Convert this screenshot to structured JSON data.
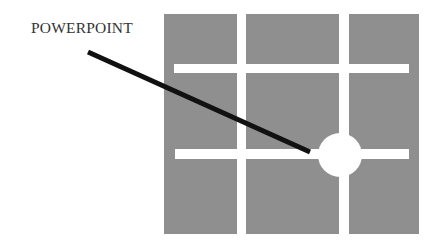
{
  "label": {
    "text": "POWERPOINT"
  },
  "colors": {
    "background": "#ffffff",
    "block": "#8f8f8f",
    "channel": "#ffffff",
    "pointer": "#111111",
    "label": "#333333"
  },
  "grid": {
    "outer": {
      "x": 164,
      "y": 14,
      "width": 255,
      "height": 220
    },
    "columns": [
      {
        "x": 164,
        "width": 73
      },
      {
        "x": 246,
        "width": 93
      },
      {
        "x": 349,
        "width": 70
      }
    ],
    "horizontal_bars": [
      {
        "x": 174,
        "y": 64,
        "width": 235,
        "height": 9
      },
      {
        "x": 175,
        "y": 149,
        "width": 234,
        "height": 10
      }
    ]
  },
  "power_point_marker": {
    "cx": 340,
    "cy": 155,
    "r": 22
  },
  "pointer_line": {
    "x1": 88,
    "y1": 52,
    "x2": 310,
    "y2": 152,
    "stroke_width": 5
  }
}
